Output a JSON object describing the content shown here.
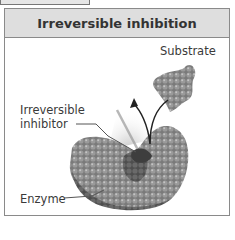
{
  "panel": {
    "title": "Irreversible inhibition"
  },
  "labels": {
    "substrate": "Substrate",
    "inhibitor_line1": "Irreversible",
    "inhibitor_line2": "inhibitor",
    "enzyme": "Enzyme"
  },
  "colors": {
    "header_bg": "#dedede",
    "border": "#8a8a8a",
    "molecule": "#808080",
    "molecule_dark": "#555555",
    "text": "#3a3a3a"
  }
}
